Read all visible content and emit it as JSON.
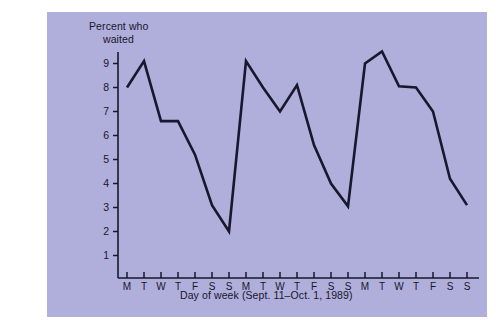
{
  "figure": {
    "panel_bg": "#b0aeda",
    "page_bg": "#ffffff",
    "ink": "#17172e",
    "line_color": "#17172e"
  },
  "axes": {
    "y_title_line1": "Percent who",
    "y_title_line2": "waited",
    "x_title": "Day of week (Sept. 11–Oct. 1, 1989)",
    "y_ticks": [
      "1",
      "2",
      "3",
      "4",
      "5",
      "6",
      "7",
      "8",
      "9"
    ],
    "x_ticks": [
      "M",
      "T",
      "W",
      "T",
      "F",
      "S",
      "S",
      "M",
      "T",
      "W",
      "T",
      "F",
      "S",
      "S",
      "M",
      "T",
      "W",
      "T",
      "F",
      "S",
      "S"
    ]
  },
  "chart_data": {
    "type": "line",
    "title": "",
    "xlabel": "Day of week (Sept. 11–Oct. 1, 1989)",
    "ylabel": "Percent who waited",
    "categories": [
      "M",
      "T",
      "W",
      "T",
      "F",
      "S",
      "S",
      "M",
      "T",
      "W",
      "T",
      "F",
      "S",
      "S",
      "M",
      "T",
      "W",
      "T",
      "F",
      "S",
      "S"
    ],
    "values": [
      8.0,
      9.1,
      6.6,
      6.6,
      5.2,
      3.1,
      2.0,
      9.1,
      8.0,
      7.0,
      8.1,
      5.6,
      4.0,
      3.05,
      9.0,
      9.5,
      8.05,
      8.0,
      7.0,
      4.2,
      3.1
    ],
    "ylim": [
      0.4,
      9.8
    ],
    "yticks": [
      1,
      2,
      3,
      4,
      5,
      6,
      7,
      8,
      9
    ],
    "grid": false,
    "legend": "none"
  }
}
